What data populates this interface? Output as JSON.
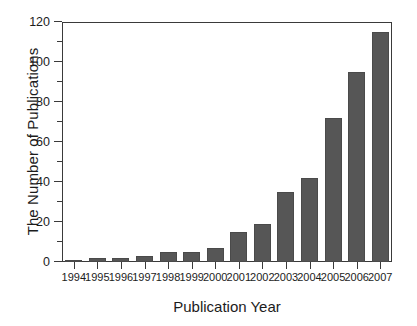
{
  "chart_data": {
    "type": "bar",
    "title": "",
    "subtitle": "",
    "xlabel": "Publication Year",
    "ylabel": "The Number of Publications",
    "categories": [
      "1994",
      "1995",
      "1996",
      "1997",
      "1998",
      "1999",
      "2000",
      "2001",
      "2002",
      "2003",
      "2004",
      "2005",
      "2006",
      "2007"
    ],
    "values": [
      1,
      2,
      2,
      3,
      5,
      5,
      7,
      15,
      19,
      35,
      42,
      72,
      95,
      115
    ],
    "series": [
      {
        "name": "Publications",
        "values": [
          1,
          2,
          2,
          3,
          5,
          5,
          7,
          15,
          19,
          35,
          42,
          72,
          95,
          115
        ]
      }
    ],
    "ylim": [
      0,
      120
    ],
    "y_major_ticks": [
      0,
      20,
      40,
      60,
      80,
      100,
      120
    ],
    "y_tick_labels": [
      "0",
      "20",
      "40",
      "60",
      "80",
      "100",
      "120"
    ],
    "y_minor_ticks": [
      10,
      30,
      50,
      70,
      90,
      110
    ],
    "x_tick_labels": [
      "1994",
      "1995",
      "1996",
      "1997",
      "1998",
      "1999",
      "2000",
      "2001",
      "2002",
      "2003",
      "2004",
      "2005",
      "2006",
      "2007"
    ],
    "grid": false,
    "legend": false,
    "legend_position": "none",
    "bar_color": "#565656",
    "bar_edge_color": "#4a4a4a",
    "axis_color": "#3a3a3a",
    "background_color": "#ffffff",
    "text_color": "#1c1c1c"
  }
}
